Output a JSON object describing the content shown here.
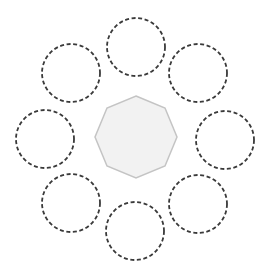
{
  "canvas": {
    "width": 270,
    "height": 273,
    "background": "#ffffff"
  },
  "center_shape": {
    "type": "octagon",
    "cx": 136,
    "cy": 137,
    "radius": 41,
    "fill": "#f2f2f2",
    "stroke": "#c4c4c4",
    "stroke_width": 1.5
  },
  "ring_circles": {
    "radius": 29,
    "stroke": "#3a3a3a",
    "stroke_width": 1.8,
    "dasharray": "4 2.6",
    "fill": "none",
    "items": [
      {
        "position": "top",
        "cx": 136,
        "cy": 47
      },
      {
        "position": "top-right",
        "cx": 198,
        "cy": 73
      },
      {
        "position": "right",
        "cx": 225,
        "cy": 140
      },
      {
        "position": "bottom-right",
        "cx": 198,
        "cy": 204
      },
      {
        "position": "bottom",
        "cx": 135,
        "cy": 231
      },
      {
        "position": "bottom-left",
        "cx": 71,
        "cy": 203
      },
      {
        "position": "left",
        "cx": 45,
        "cy": 139
      },
      {
        "position": "top-left",
        "cx": 71,
        "cy": 73
      }
    ]
  }
}
